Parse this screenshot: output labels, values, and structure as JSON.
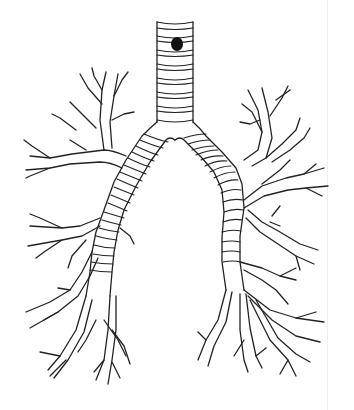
{
  "figure": {
    "style": "black line drawing on white background",
    "parts": [
      "trachea",
      "left main bronchus",
      "right main bronchus",
      "lobar bronchi",
      "segmental bronchi"
    ],
    "marker": {
      "shape": "filled oval",
      "color": "#111111",
      "location": "upper trachea"
    }
  },
  "colors": {
    "background": "#ffffff",
    "stroke": "#222222",
    "edge_line": "#eeeeee"
  }
}
